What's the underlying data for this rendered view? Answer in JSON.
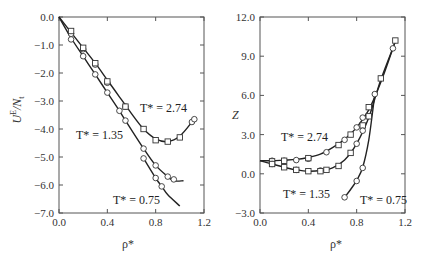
{
  "chart_data": [
    {
      "type": "line",
      "panel": "left",
      "title": "",
      "xlabel": "ρ*",
      "ylabel": "U^E/N_t",
      "xlim": [
        0.0,
        1.2
      ],
      "ylim": [
        -7.0,
        0.0
      ],
      "xticks": [
        "0.0",
        "0.4",
        "0.8",
        "1.2"
      ],
      "yticks": [
        "0.0",
        "-1.0",
        "-2.0",
        "-3.0",
        "-4.0",
        "-5.0",
        "-6.0",
        "-7.0"
      ],
      "grid": false,
      "series": [
        {
          "name": "T* = 2.74",
          "label": "T* = 2.74",
          "line": {
            "x": [
              0.0,
              0.1,
              0.2,
              0.3,
              0.4,
              0.5,
              0.6,
              0.7,
              0.8,
              0.9,
              1.0,
              1.1,
              1.12
            ],
            "y": [
              0.0,
              -0.55,
              -1.1,
              -1.65,
              -2.25,
              -2.85,
              -3.45,
              -4.0,
              -4.35,
              -4.45,
              -4.25,
              -3.75,
              -3.6
            ]
          },
          "markers_circle": {
            "x": [
              0.1,
              0.2,
              0.3,
              0.4,
              0.55,
              1.1,
              1.12
            ],
            "y": [
              -0.6,
              -1.15,
              -1.7,
              -2.35,
              -3.2,
              -3.75,
              -3.65
            ]
          },
          "markers_square": {
            "x": [
              0.1,
              0.2,
              0.3,
              0.4,
              0.55,
              0.7,
              0.8,
              0.9,
              1.0
            ],
            "y": [
              -0.5,
              -1.1,
              -1.65,
              -2.3,
              -3.2,
              -4.0,
              -4.4,
              -4.45,
              -4.3
            ]
          }
        },
        {
          "name": "T* = 1.35",
          "label": "T* = 1.35",
          "line": {
            "x": [
              0.0,
              0.1,
              0.2,
              0.3,
              0.4,
              0.5,
              0.55,
              0.7,
              0.8,
              0.9,
              0.95,
              1.03
            ],
            "y": [
              0.0,
              -0.75,
              -1.4,
              -2.05,
              -2.7,
              -3.35,
              -3.7,
              -4.7,
              -5.3,
              -5.7,
              -5.85,
              -5.85
            ]
          },
          "markers_circle": {
            "x": [
              0.1,
              0.2,
              0.3,
              0.4,
              0.5,
              0.55,
              0.7,
              0.8,
              0.9,
              0.95
            ],
            "y": [
              -0.8,
              -1.4,
              -2.05,
              -2.7,
              -3.35,
              -3.7,
              -4.7,
              -5.3,
              -5.7,
              -5.8
            ]
          }
        },
        {
          "name": "T* = 0.75",
          "label": "T* = 0.75",
          "line": {
            "x": [
              0.7,
              0.8,
              0.85,
              0.9,
              1.0
            ],
            "y": [
              -5.05,
              -5.75,
              -6.05,
              -6.35,
              -6.75
            ]
          },
          "markers_circle": {
            "x": [
              0.7,
              0.8,
              0.85
            ],
            "y": [
              -5.05,
              -5.75,
              -6.05
            ]
          }
        }
      ],
      "annotations": [
        {
          "text": "T* = 2.74",
          "x": 0.91,
          "y": -3.35
        },
        {
          "text": "T* = 1.35",
          "x": 0.25,
          "y": -4.3
        },
        {
          "text": "T* = 0.75",
          "x": 0.75,
          "y": -6.5
        }
      ]
    },
    {
      "type": "line",
      "panel": "right",
      "title": "",
      "xlabel": "ρ*",
      "ylabel": "Z",
      "xlim": [
        0.0,
        1.2
      ],
      "ylim": [
        -3.0,
        12.0
      ],
      "xticks": [
        "0.0",
        "0.4",
        "0.8",
        "1.2"
      ],
      "yticks": [
        "12.0",
        "9.0",
        "6.0",
        "3.0",
        "0.0",
        "-3.0"
      ],
      "grid": false,
      "series": [
        {
          "name": "T* = 2.74",
          "label": "T* = 2.74",
          "line": {
            "x": [
              0.0,
              0.1,
              0.2,
              0.3,
              0.4,
              0.5,
              0.6,
              0.7,
              0.8,
              0.9,
              1.0,
              1.1,
              1.12
            ],
            "y": [
              1.0,
              1.0,
              1.05,
              1.1,
              1.25,
              1.5,
              2.0,
              2.65,
              3.55,
              4.9,
              7.0,
              9.6,
              10.2
            ]
          },
          "markers_circle": {
            "x": [
              0.1,
              0.2,
              0.3,
              0.4,
              0.55,
              0.7,
              0.8,
              0.85,
              0.95,
              1.1
            ],
            "y": [
              1.0,
              1.0,
              1.05,
              1.15,
              1.65,
              2.6,
              3.55,
              4.3,
              6.1,
              9.6
            ]
          },
          "markers_square": {
            "x": [
              0.1,
              0.2,
              0.4,
              0.65,
              0.75,
              0.85,
              0.9,
              1.0,
              1.12
            ],
            "y": [
              0.95,
              1.0,
              1.2,
              2.2,
              3.0,
              3.7,
              5.1,
              7.3,
              10.2
            ]
          }
        },
        {
          "name": "T* = 1.35",
          "label": "T* = 1.35",
          "line": {
            "x": [
              0.0,
              0.1,
              0.2,
              0.3,
              0.4,
              0.5,
              0.6,
              0.7,
              0.8,
              0.9,
              1.0,
              1.12
            ],
            "y": [
              1.0,
              0.75,
              0.5,
              0.3,
              0.2,
              0.25,
              0.45,
              1.05,
              2.3,
              4.3,
              7.2,
              10.1
            ]
          },
          "markers_circle": {
            "x": [
              0.1,
              0.3,
              0.5,
              0.8,
              0.85
            ],
            "y": [
              0.75,
              0.3,
              0.25,
              2.3,
              3.3
            ]
          },
          "markers_square": {
            "x": [
              0.1,
              0.2,
              0.3,
              0.4,
              0.5,
              0.55,
              0.65,
              0.75,
              0.9
            ],
            "y": [
              0.75,
              0.5,
              0.3,
              0.2,
              0.2,
              0.3,
              0.6,
              1.6,
              4.4
            ]
          }
        },
        {
          "name": "T* = 0.75",
          "label": "T* = 0.75",
          "line": {
            "x": [
              0.7,
              0.75,
              0.8,
              0.85,
              0.9,
              0.95
            ],
            "y": [
              -1.8,
              -1.2,
              -0.5,
              0.5,
              2.6,
              6.1
            ]
          },
          "markers_circle": {
            "x": [
              0.7,
              0.8,
              0.85
            ],
            "y": [
              -1.8,
              -0.55,
              0.45
            ]
          }
        }
      ],
      "annotations": [
        {
          "text": "T* = 2.74",
          "x": 0.3,
          "y": 3.0
        },
        {
          "text": "T* = 1.35",
          "x": 0.3,
          "y": -1.4
        },
        {
          "text": "T* = 0.75",
          "x": 1.0,
          "y": -1.9
        }
      ]
    }
  ],
  "labels": {
    "left_ylabel_main": "U",
    "left_ylabel_sup": "E",
    "left_ylabel_rest": "/N",
    "left_ylabel_sub": "t",
    "right_ylabel": "Z",
    "xlabel": "ρ*",
    "ann_274": "T* = 2.74",
    "ann_135": "T* = 1.35",
    "ann_075": "T* = 0.75"
  }
}
